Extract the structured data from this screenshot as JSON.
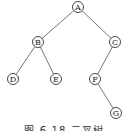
{
  "diagram": {
    "type": "binary-tree",
    "nodes": [
      {
        "id": "A",
        "label": "A",
        "x": 78,
        "y": 7
      },
      {
        "id": "B",
        "label": "B",
        "x": 38,
        "y": 42
      },
      {
        "id": "C",
        "label": "C",
        "x": 115,
        "y": 42
      },
      {
        "id": "D",
        "label": "D",
        "x": 13,
        "y": 79
      },
      {
        "id": "E",
        "label": "E",
        "x": 56,
        "y": 79
      },
      {
        "id": "F",
        "label": "F",
        "x": 95,
        "y": 79
      },
      {
        "id": "G",
        "label": "G",
        "x": 116,
        "y": 113
      }
    ],
    "edges": [
      [
        "A",
        "B"
      ],
      [
        "A",
        "C"
      ],
      [
        "B",
        "D"
      ],
      [
        "B",
        "E"
      ],
      [
        "C",
        "F"
      ],
      [
        "F",
        "G"
      ]
    ],
    "caption": "图 6-18  二叉树"
  }
}
